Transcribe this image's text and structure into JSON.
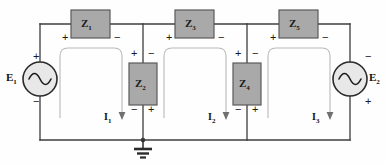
{
  "diagram": {
    "type": "electrical-circuit-schematic",
    "colors": {
      "wire": "#3c3c3c",
      "impedance_fill": "#a9a9a9",
      "impedance_stroke": "#555555",
      "mesh_loop": "#b4b4b4",
      "background": "#fefefe",
      "text": "#111111"
    }
  },
  "sources": [
    {
      "id": "E1",
      "label": "E",
      "subscript": "1",
      "symbol": "ac-source",
      "label_side": "left",
      "plus_position": "top",
      "minus_position": "bottom",
      "plus": "+",
      "minus": "−"
    },
    {
      "id": "E2",
      "label": "E",
      "subscript": "2",
      "symbol": "ac-source",
      "label_side": "right",
      "plus_position": "bottom",
      "minus_position": "top",
      "plus": "+",
      "minus": "−"
    }
  ],
  "impedances": [
    {
      "id": "Z1",
      "label": "Z",
      "subscript": "1",
      "orientation": "horizontal",
      "branch": "top",
      "left_sign": "+",
      "right_sign": "−"
    },
    {
      "id": "Z2",
      "label": "Z",
      "subscript": "2",
      "orientation": "vertical",
      "branch": "shunt",
      "top_left_sign": "+",
      "top_right_sign": "−",
      "bottom_left_sign": "−",
      "bottom_right_sign": "+"
    },
    {
      "id": "Z3",
      "label": "Z",
      "subscript": "3",
      "orientation": "horizontal",
      "branch": "top",
      "left_sign": "+",
      "right_sign": "−"
    },
    {
      "id": "Z4",
      "label": "Z",
      "subscript": "4",
      "orientation": "vertical",
      "branch": "shunt",
      "top_left_sign": "+",
      "top_right_sign": "−",
      "bottom_left_sign": "−",
      "bottom_right_sign": "+"
    },
    {
      "id": "Z5",
      "label": "Z",
      "subscript": "5",
      "orientation": "horizontal",
      "branch": "top",
      "left_sign": "+",
      "right_sign": "−"
    }
  ],
  "mesh_currents": [
    {
      "id": "I1",
      "label": "I",
      "subscript": "1",
      "direction": "clockwise",
      "arrow": "down"
    },
    {
      "id": "I2",
      "label": "I",
      "subscript": "2",
      "direction": "clockwise",
      "arrow": "down"
    },
    {
      "id": "I3",
      "label": "I",
      "subscript": "3",
      "direction": "clockwise",
      "arrow": "down"
    }
  ],
  "ground": {
    "id": "GND",
    "symbol": "earth-ground",
    "bars": 3,
    "attached_node": "bottom-rail-center"
  }
}
